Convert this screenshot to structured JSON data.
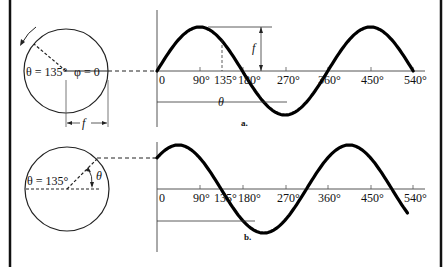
{
  "figure": {
    "panels": [
      {
        "id": "a",
        "caption": "a.",
        "phasor_labels": {
          "theta": "θ = 135°",
          "phi": "φ = 0",
          "amplitude": "f"
        },
        "graph_labels": {
          "amplitude": "f",
          "theta_span": "θ"
        },
        "x_ticks": [
          "0",
          "90°",
          "135°",
          "180°",
          "270°",
          "360°",
          "450°",
          "540°"
        ],
        "phase_deg": 0
      },
      {
        "id": "b",
        "caption": "b.",
        "phasor_labels": {
          "theta": "θ = 135°",
          "angle": "θ"
        },
        "x_ticks": [
          "0",
          "90°",
          "135°",
          "180°",
          "270°",
          "360°",
          "450°",
          "540°"
        ],
        "phase_deg": 45
      }
    ]
  },
  "colors": {
    "ink": "#111111",
    "axis": "#555555",
    "background": "#ffffff"
  }
}
